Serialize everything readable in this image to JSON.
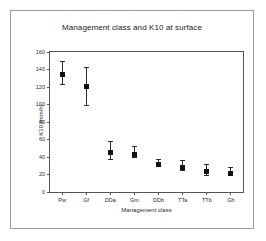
{
  "figure": {
    "border_color": "#9a9a9a",
    "background": "#ffffff"
  },
  "chart_data": {
    "type": "scatter",
    "title": "Management class and K10 at surface",
    "xlabel": "Management class",
    "ylabel": "K10 (mm/h)",
    "categories": [
      "Pw",
      "Gf",
      "DDa",
      "Gm",
      "DDb",
      "TTa",
      "TTb",
      "Gh"
    ],
    "values": [
      137,
      124,
      48,
      46,
      34,
      31,
      26,
      24
    ],
    "error_low": [
      124,
      100,
      38,
      40,
      30,
      25,
      20,
      19
    ],
    "error_high": [
      150,
      143,
      58,
      53,
      38,
      37,
      32,
      29
    ],
    "ylim": [
      0,
      160
    ],
    "yticks": [
      0,
      20,
      40,
      60,
      80,
      100,
      120,
      140,
      160
    ],
    "ytick_labels": [
      "0",
      "20",
      "40",
      "60",
      "80",
      "100",
      "120",
      "140",
      "160"
    ],
    "grid": false,
    "legend": false,
    "marker_color": "#111111",
    "errorbar_color": "#2b2b2b",
    "axis_color": "#555555"
  }
}
